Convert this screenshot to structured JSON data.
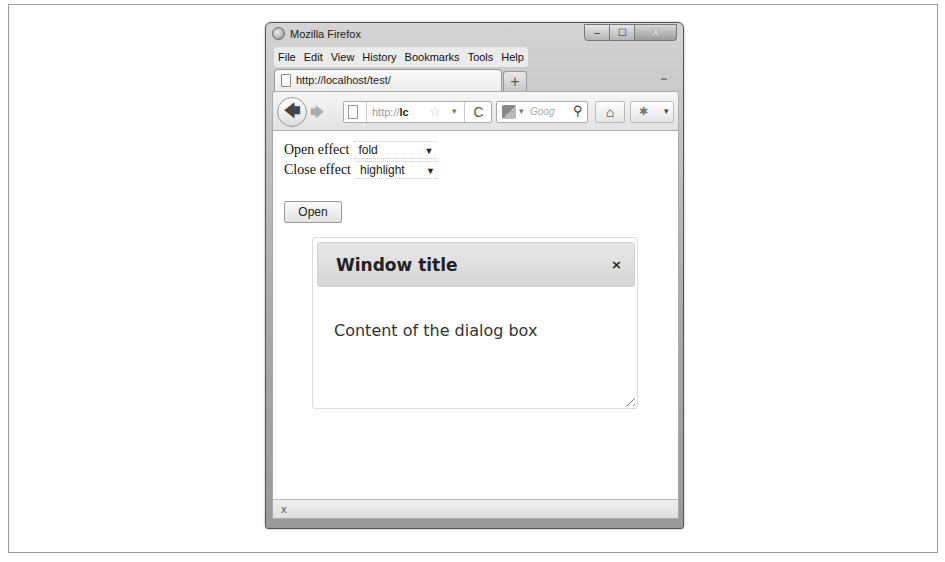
{
  "window": {
    "title": "Mozilla Firefox",
    "controls": {
      "minimize": "–",
      "maximize": "☐",
      "close": "X"
    }
  },
  "menubar": {
    "items": [
      {
        "label": "File",
        "accel": "F"
      },
      {
        "label": "Edit",
        "accel": "E"
      },
      {
        "label": "View",
        "accel": "V"
      },
      {
        "label": "History",
        "accel": "s"
      },
      {
        "label": "Bookmarks",
        "accel": "B"
      },
      {
        "label": "Tools",
        "accel": "T"
      },
      {
        "label": "Help",
        "accel": "H"
      }
    ]
  },
  "tabs": [
    {
      "label": "http://localhost/test/"
    }
  ],
  "newtab_label": "+",
  "navbar": {
    "back": "🡄",
    "forward": "🡆",
    "url_prefix": "http://",
    "url_host": "lc",
    "star": "☆",
    "url_dropdown": "▾",
    "reload": "C",
    "search_engine_dropdown": "▾",
    "search_placeholder": "Goog",
    "search_icon": "⚲",
    "home": "⌂",
    "addon_dropdown": "▾"
  },
  "form": {
    "open_effect": {
      "label": "Open effect",
      "value": "fold"
    },
    "close_effect": {
      "label": "Close effect",
      "value": "highlight"
    },
    "select_arrow": "▼",
    "open_button": "Open"
  },
  "dialog": {
    "title": "Window title",
    "close": "×",
    "content": "Content of the dialog box"
  },
  "statusbar": {
    "close": "x"
  }
}
